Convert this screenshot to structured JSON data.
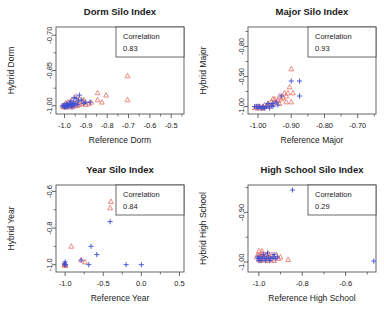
{
  "figure": {
    "layout": "2x2 grid of scatter plots",
    "marker_colors": {
      "reference_triangle": "#e8766d",
      "hybrid_plus": "#3b4fd8"
    },
    "axis_color": "#555555",
    "text_color": "#1a1a1a"
  },
  "chart_data": [
    {
      "type": "scatter",
      "title": "Dorm Silo Index",
      "xlabel": "Reference Dorm",
      "ylabel": "Hybrid Dorm",
      "xlim": [
        -1.04,
        -0.44
      ],
      "ylim": [
        -1.035,
        -0.665
      ],
      "xticks": [
        -1.0,
        -0.9,
        -0.8,
        -0.7,
        -0.6,
        -0.5
      ],
      "xticklabels": [
        "-1.0",
        "-0.9",
        "-0.8",
        "-0.7",
        "-0.6",
        "-0.5"
      ],
      "yticks": [
        -1.0,
        -0.85,
        -0.7
      ],
      "yticklabels": [
        "-1.00",
        "-0.85",
        "-0.70"
      ],
      "grid": false,
      "annotation": {
        "label": "Correlation",
        "value": "0.83",
        "position": "top-right-box"
      },
      "series": [
        {
          "name": "triangles",
          "marker": "open-triangle",
          "color": "#e8766d",
          "points": [
            [
              -0.455,
              -0.688
            ],
            [
              -0.705,
              -0.873
            ],
            [
              -0.705,
              -0.975
            ],
            [
              -0.805,
              -0.955
            ],
            [
              -0.845,
              -0.975
            ],
            [
              -0.825,
              -0.985
            ],
            [
              -0.845,
              -0.945
            ],
            [
              -0.875,
              -0.985
            ],
            [
              -0.885,
              -0.99
            ],
            [
              -0.9,
              -0.995
            ],
            [
              -0.91,
              -0.985
            ],
            [
              -0.92,
              -0.99
            ],
            [
              -0.93,
              -0.995
            ],
            [
              -0.935,
              -0.985
            ],
            [
              -0.94,
              -1.0
            ],
            [
              -0.95,
              -0.99
            ],
            [
              -0.955,
              -1.0
            ],
            [
              -0.96,
              -0.995
            ],
            [
              -0.965,
              -1.005
            ],
            [
              -0.97,
              -0.99
            ],
            [
              -0.975,
              -1.0
            ],
            [
              -0.98,
              -1.005
            ],
            [
              -0.985,
              -0.995
            ],
            [
              -0.99,
              -1.0
            ],
            [
              -0.995,
              -1.005
            ],
            [
              -1.0,
              -1.0
            ],
            [
              -1.005,
              -1.005
            ],
            [
              -1.01,
              -1.0
            ],
            [
              -0.93,
              -0.97
            ],
            [
              -0.945,
              -0.96
            ],
            [
              -0.91,
              -0.975
            ],
            [
              -0.965,
              -0.975
            ],
            [
              -0.985,
              -0.985
            ],
            [
              -0.995,
              -0.99
            ],
            [
              -1.0,
              -0.995
            ],
            [
              -0.975,
              -0.985
            ]
          ]
        },
        {
          "name": "pluses",
          "marker": "plus",
          "color": "#3b4fd8",
          "points": [
            [
              -0.93,
              -0.955
            ],
            [
              -0.945,
              -0.97
            ],
            [
              -0.955,
              -0.965
            ],
            [
              -0.96,
              -0.985
            ],
            [
              -0.965,
              -0.995
            ],
            [
              -0.97,
              -1.0
            ],
            [
              -0.975,
              -0.99
            ],
            [
              -0.98,
              -1.0
            ],
            [
              -0.985,
              -0.995
            ],
            [
              -0.99,
              -1.0
            ],
            [
              -0.995,
              -1.005
            ],
            [
              -1.0,
              -1.0
            ],
            [
              -1.005,
              -1.0
            ],
            [
              -0.92,
              -0.975
            ],
            [
              -0.935,
              -0.98
            ],
            [
              -0.95,
              -0.99
            ],
            [
              -0.955,
              -1.0
            ],
            [
              -0.965,
              -1.005
            ],
            [
              -0.985,
              -1.005
            ],
            [
              -1.0,
              -1.005
            ],
            [
              -0.9,
              -0.985
            ],
            [
              -0.91,
              -0.99
            ],
            [
              -0.94,
              -0.995
            ],
            [
              -0.97,
              -0.98
            ],
            [
              -0.99,
              -0.99
            ],
            [
              -1.01,
              -1.0
            ],
            [
              -0.88,
              -0.985
            ]
          ]
        }
      ]
    },
    {
      "type": "scatter",
      "title": "Major Silo Index",
      "xlabel": "Reference Major",
      "ylabel": "Hybrid Major",
      "xlim": [
        -1.03,
        -0.645
      ],
      "ylim": [
        -1.025,
        -0.735
      ],
      "xticks": [
        -1.0,
        -0.9,
        -0.8,
        -0.7
      ],
      "xticklabels": [
        "-1.00",
        "-0.90",
        "-0.80",
        "-0.70"
      ],
      "yticks": [
        -1.0,
        -0.9,
        -0.8
      ],
      "yticklabels": [
        "-1.00",
        "-0.90",
        "-0.80"
      ],
      "grid": false,
      "annotation": {
        "label": "Correlation",
        "value": "0.93",
        "position": "top-right-box"
      },
      "series": [
        {
          "name": "triangles",
          "marker": "open-triangle",
          "color": "#e8766d",
          "points": [
            [
              -0.9,
              -0.875
            ],
            [
              -0.905,
              -0.935
            ],
            [
              -0.91,
              -0.955
            ],
            [
              -0.915,
              -0.965
            ],
            [
              -0.92,
              -0.955
            ],
            [
              -0.925,
              -0.97
            ],
            [
              -0.93,
              -0.975
            ],
            [
              -0.935,
              -0.965
            ],
            [
              -0.94,
              -0.98
            ],
            [
              -0.945,
              -0.985
            ],
            [
              -0.95,
              -0.975
            ],
            [
              -0.955,
              -0.99
            ],
            [
              -0.96,
              -0.985
            ],
            [
              -0.965,
              -0.995
            ],
            [
              -0.97,
              -0.99
            ],
            [
              -0.975,
              -1.0
            ],
            [
              -0.98,
              -0.995
            ],
            [
              -0.985,
              -1.0
            ],
            [
              -0.99,
              -1.005
            ],
            [
              -0.995,
              -1.0
            ],
            [
              -1.0,
              -1.005
            ],
            [
              -1.005,
              -1.0
            ],
            [
              -1.01,
              -1.005
            ],
            [
              -0.895,
              -0.955
            ],
            [
              -0.9,
              -0.985
            ],
            [
              -0.915,
              -0.985
            ],
            [
              -0.935,
              -0.99
            ],
            [
              -0.955,
              -0.975
            ],
            [
              -0.97,
              -1.0
            ],
            [
              -0.985,
              -1.005
            ],
            [
              -1.0,
              -1.0
            ]
          ]
        },
        {
          "name": "pluses",
          "marker": "plus",
          "color": "#3b4fd8",
          "points": [
            [
              -0.665,
              -0.745
            ],
            [
              -0.875,
              -0.915
            ],
            [
              -0.9,
              -0.915
            ],
            [
              -0.875,
              -0.965
            ],
            [
              -0.93,
              -0.965
            ],
            [
              -0.945,
              -0.985
            ],
            [
              -0.955,
              -0.99
            ],
            [
              -0.96,
              -0.995
            ],
            [
              -0.97,
              -0.99
            ],
            [
              -0.975,
              -1.0
            ],
            [
              -0.98,
              -1.005
            ],
            [
              -0.985,
              -1.0
            ],
            [
              -0.99,
              -1.005
            ],
            [
              -0.995,
              -1.0
            ],
            [
              -1.0,
              -1.005
            ],
            [
              -1.005,
              -1.0
            ],
            [
              -0.94,
              -0.995
            ],
            [
              -0.955,
              -1.0
            ],
            [
              -0.965,
              -1.005
            ],
            [
              -0.985,
              -1.005
            ],
            [
              -1.0,
              -1.0
            ],
            [
              -1.01,
              -1.0
            ]
          ]
        }
      ]
    },
    {
      "type": "scatter",
      "title": "Year Silo Index",
      "xlabel": "Reference Year",
      "ylabel": "Hybrid Year",
      "xlim": [
        -1.12,
        0.56
      ],
      "ylim": [
        -1.04,
        -0.565
      ],
      "xticks": [
        -1.0,
        -0.5,
        0.0,
        0.5
      ],
      "xticklabels": [
        "-1.0",
        "-0.5",
        "0.0",
        "0.5"
      ],
      "yticks": [
        -1.0,
        -0.8,
        -0.6
      ],
      "yticklabels": [
        "-1.0",
        "-0.8",
        "-0.6"
      ],
      "grid": false,
      "annotation": {
        "label": "Correlation",
        "value": "0.84",
        "position": "top-right-box"
      },
      "series": [
        {
          "name": "triangles",
          "marker": "open-triangle",
          "color": "#e8766d",
          "points": [
            [
              -0.2,
              -0.61
            ],
            [
              -0.4,
              -0.655
            ],
            [
              -0.41,
              -0.69
            ],
            [
              -0.92,
              -0.9
            ],
            [
              -0.79,
              -0.975
            ],
            [
              -0.74,
              -0.985
            ],
            [
              -1.0,
              -0.995
            ],
            [
              -1.01,
              -1.0
            ],
            [
              -0.995,
              -1.005
            ],
            [
              -1.005,
              -0.998
            ],
            [
              -1.0,
              -1.002
            ]
          ]
        },
        {
          "name": "pluses",
          "marker": "plus",
          "color": "#3b4fd8",
          "points": [
            [
              0.0,
              -0.595
            ],
            [
              0.48,
              -0.595
            ],
            [
              -0.41,
              -0.765
            ],
            [
              -0.66,
              -0.9
            ],
            [
              -0.585,
              -0.945
            ],
            [
              -0.79,
              -0.975
            ],
            [
              -0.69,
              -1.0
            ],
            [
              -0.2,
              -1.0
            ],
            [
              0.0,
              -1.0
            ],
            [
              -1.0,
              -0.985
            ],
            [
              -1.005,
              -1.0
            ],
            [
              -0.995,
              -1.0
            ],
            [
              -1.01,
              -0.995
            ]
          ]
        }
      ]
    },
    {
      "type": "scatter",
      "title": "High School Silo Index",
      "xlabel": "Reference High School",
      "ylabel": "Hybrid High School",
      "xlim": [
        -1.05,
        -0.46
      ],
      "ylim": [
        -1.02,
        -0.845
      ],
      "xticks": [
        -1.0,
        -0.8,
        -0.6
      ],
      "xticklabels": [
        "-1.0",
        "-0.8",
        "-0.6"
      ],
      "yticks": [
        -1.0,
        -0.9
      ],
      "yticklabels": [
        "-1.00",
        "-0.90"
      ],
      "grid": false,
      "annotation": {
        "label": "Correlation",
        "value": "0.29",
        "position": "top-right-box"
      },
      "series": [
        {
          "name": "triangles",
          "marker": "open-triangle",
          "color": "#e8766d",
          "points": [
            [
              -0.865,
              -0.995
            ],
            [
              -0.9,
              -0.99
            ],
            [
              -0.92,
              -0.985
            ],
            [
              -0.93,
              -0.99
            ],
            [
              -0.94,
              -0.985
            ],
            [
              -0.95,
              -0.99
            ],
            [
              -0.955,
              -0.983
            ],
            [
              -0.96,
              -0.99
            ],
            [
              -0.965,
              -0.985
            ],
            [
              -0.97,
              -0.99
            ],
            [
              -0.975,
              -0.985
            ],
            [
              -0.98,
              -0.99
            ],
            [
              -0.985,
              -0.983
            ],
            [
              -0.99,
              -0.99
            ],
            [
              -0.995,
              -0.985
            ],
            [
              -1.0,
              -0.99
            ],
            [
              -1.005,
              -0.985
            ],
            [
              -1.01,
              -0.99
            ],
            [
              -0.945,
              -0.995
            ],
            [
              -0.96,
              -0.997
            ],
            [
              -0.975,
              -0.995
            ],
            [
              -0.99,
              -0.997
            ],
            [
              -1.0,
              -0.995
            ],
            [
              -0.93,
              -0.997
            ],
            [
              -0.91,
              -0.993
            ],
            [
              -0.985,
              -0.978
            ],
            [
              -1.0,
              -0.978
            ]
          ]
        },
        {
          "name": "pluses",
          "marker": "plus",
          "color": "#3b4fd8",
          "points": [
            [
              -0.845,
              -0.855
            ],
            [
              -0.47,
              -0.998
            ],
            [
              -0.915,
              -0.99
            ],
            [
              -0.925,
              -0.993
            ],
            [
              -0.935,
              -0.99
            ],
            [
              -0.945,
              -0.993
            ],
            [
              -0.955,
              -0.99
            ],
            [
              -0.965,
              -0.993
            ],
            [
              -0.975,
              -0.99
            ],
            [
              -0.985,
              -0.993
            ],
            [
              -0.995,
              -0.99
            ],
            [
              -1.0,
              -0.993
            ],
            [
              -1.005,
              -0.99
            ],
            [
              -0.95,
              -0.997
            ],
            [
              -0.97,
              -0.997
            ],
            [
              -0.99,
              -0.997
            ],
            [
              -1.0,
              -0.997
            ],
            [
              -0.93,
              -0.985
            ],
            [
              -0.96,
              -0.982
            ],
            [
              -0.98,
              -0.985
            ]
          ]
        }
      ]
    }
  ]
}
